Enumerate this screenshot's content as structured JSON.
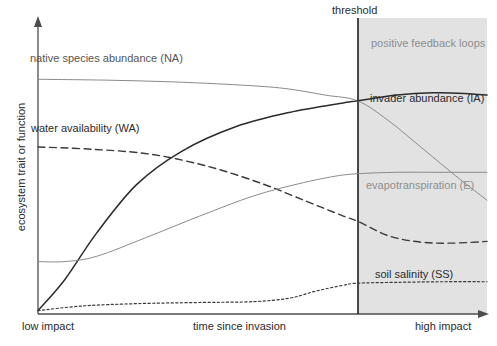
{
  "figure": {
    "background_color": "#ffffff",
    "shaded_region_color": "#e2e2e2",
    "axis_color": "#4d4d4d",
    "threshold_line_color": "#333333"
  },
  "axes": {
    "y_axis_label": "ecosystem trait or function",
    "x_axis_label": "time since invasion",
    "x_axis_left_label": "low impact",
    "x_axis_right_label": "high impact"
  },
  "annotations": {
    "threshold_label": "threshold",
    "shaded_region_label": "positive feedback loops"
  },
  "series_labels": {
    "native_species_abundance": "native species abundance (NA)",
    "water_availability": "water availability (WA)",
    "invader_abundance": "invader abundance (IA)",
    "evapotranspiration": "evapotranspiration (E)",
    "soil_salinity": "soil salinity (SS)"
  },
  "chart_data": {
    "type": "line",
    "title": "",
    "xlabel": "time since invasion",
    "ylabel": "ecosystem trait or function",
    "xlim": [
      0,
      1
    ],
    "ylim": [
      0,
      1
    ],
    "grid": false,
    "legend": "inline-annotations",
    "x_tick_labels": [
      "low impact",
      "high impact"
    ],
    "y_tick_labels": [],
    "annotations": [
      {
        "name": "threshold",
        "text": "threshold",
        "x": 0.712,
        "type": "vertical-line"
      },
      {
        "name": "positive-feedback-loops",
        "text": "positive feedback loops",
        "x_range": [
          0.712,
          1.0
        ],
        "type": "shaded-region"
      }
    ],
    "series": [
      {
        "name": "native species abundance (NA)",
        "abbr": "NA",
        "style": "solid",
        "color": "#8a8a8a",
        "width": 1,
        "x": [
          0.0,
          0.15,
          0.3,
          0.45,
          0.55,
          0.64,
          0.712,
          0.78,
          0.86,
          0.93,
          1.0
        ],
        "y": [
          0.815,
          0.812,
          0.806,
          0.795,
          0.783,
          0.76,
          0.74,
          0.672,
          0.57,
          0.48,
          0.395
        ]
      },
      {
        "name": "water availability (WA)",
        "abbr": "WA",
        "style": "dashed",
        "color": "#3a3a3a",
        "width": 1.4,
        "x": [
          0.0,
          0.12,
          0.25,
          0.38,
          0.5,
          0.6,
          0.68,
          0.712,
          0.78,
          0.85,
          0.92,
          1.0
        ],
        "y": [
          0.58,
          0.572,
          0.555,
          0.512,
          0.452,
          0.39,
          0.34,
          0.322,
          0.272,
          0.25,
          0.246,
          0.252
        ]
      },
      {
        "name": "invader abundance (IA)",
        "abbr": "IA",
        "style": "solid",
        "color": "#2b2b2b",
        "width": 1.5,
        "x": [
          0.0,
          0.06,
          0.13,
          0.22,
          0.32,
          0.44,
          0.56,
          0.68,
          0.712,
          0.8,
          0.88,
          0.95,
          1.0
        ],
        "y": [
          0.012,
          0.12,
          0.28,
          0.45,
          0.565,
          0.65,
          0.7,
          0.733,
          0.74,
          0.76,
          0.768,
          0.766,
          0.76
        ]
      },
      {
        "name": "evapotranspiration (E)",
        "abbr": "E",
        "style": "solid",
        "color": "#8a8a8a",
        "width": 1,
        "x": [
          0.0,
          0.06,
          0.13,
          0.24,
          0.36,
          0.48,
          0.58,
          0.66,
          0.712,
          0.8,
          0.9,
          1.0
        ],
        "y": [
          0.182,
          0.182,
          0.2,
          0.265,
          0.34,
          0.41,
          0.452,
          0.478,
          0.487,
          0.492,
          0.492,
          0.492
        ]
      },
      {
        "name": "soil salinity (SS)",
        "abbr": "SS",
        "style": "dotted",
        "color": "#3a3a3a",
        "width": 1.2,
        "x": [
          0.0,
          0.1,
          0.22,
          0.36,
          0.48,
          0.56,
          0.62,
          0.68,
          0.712,
          0.8,
          0.9,
          1.0
        ],
        "y": [
          0.012,
          0.028,
          0.036,
          0.04,
          0.043,
          0.055,
          0.08,
          0.1,
          0.107,
          0.11,
          0.112,
          0.112
        ]
      }
    ]
  }
}
